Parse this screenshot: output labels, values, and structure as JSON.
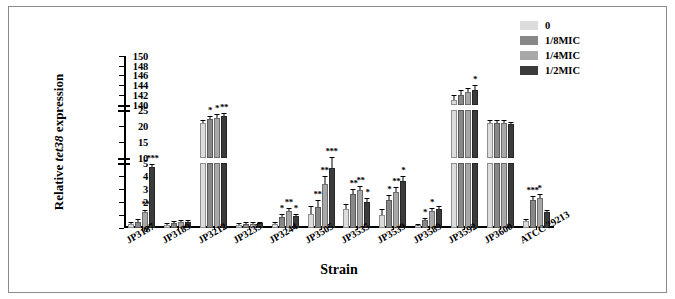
{
  "figure": {
    "background": "#ffffff",
    "border_color": "#8a8a8a"
  },
  "legend": {
    "position": "top-right",
    "items": [
      {
        "label": "0",
        "color": "#dcdcdc"
      },
      {
        "label": "1/8MIC",
        "color": "#888888"
      },
      {
        "label": "1/4MIC",
        "color": "#a8a8a8"
      },
      {
        "label": "1/2MIC",
        "color": "#3b3b3b"
      }
    ]
  },
  "chart_data": {
    "type": "bar",
    "title": "",
    "xlabel": "Strain",
    "ylabel": "Relative tet38 expression",
    "ylabel_italic_part": "tet38",
    "grid": false,
    "broken_axis": true,
    "axis_segments": [
      {
        "name": "lower",
        "range": [
          0,
          5
        ],
        "ticks": [
          0,
          1,
          2,
          3,
          4,
          5
        ],
        "height_frac": 0.4
      },
      {
        "name": "middle",
        "range": [
          10,
          25
        ],
        "ticks": [
          10,
          15,
          20,
          25
        ],
        "height_frac": 0.3
      },
      {
        "name": "upper",
        "range": [
          140,
          150
        ],
        "ticks": [
          140,
          142,
          144,
          146,
          148,
          150
        ],
        "height_frac": 0.3
      }
    ],
    "categories": [
      "JP3187",
      "JP3189",
      "JP3212",
      "JP3235",
      "JP3244",
      "JP3505",
      "JP3535",
      "JP3539",
      "JP3589",
      "JP3592",
      "JP3600",
      "ATCC 29213"
    ],
    "series": [
      {
        "name": "0",
        "color": "#dcdcdc",
        "values": [
          0.3,
          0.25,
          21.0,
          0.25,
          0.3,
          1.1,
          1.5,
          1.0,
          0.2,
          141.0,
          21.0,
          0.55
        ]
      },
      {
        "name": "1/8MIC",
        "color": "#888888",
        "values": [
          0.5,
          0.4,
          22.0,
          0.3,
          0.85,
          1.6,
          2.6,
          2.2,
          0.6,
          142.0,
          21.0,
          2.2
        ]
      },
      {
        "name": "1/4MIC",
        "color": "#a8a8a8",
        "values": [
          1.2,
          0.45,
          22.5,
          0.3,
          1.35,
          3.4,
          2.9,
          2.8,
          1.3,
          142.5,
          21.0,
          2.3
        ]
      },
      {
        "name": "1/2MIC",
        "color": "#3b3b3b",
        "values": [
          4.7,
          0.5,
          23.0,
          0.35,
          0.9,
          4.6,
          2.0,
          3.6,
          1.5,
          143.0,
          20.5,
          1.2
        ]
      }
    ],
    "errors": [
      {
        "name": "0",
        "values": [
          0.08,
          0.06,
          0.6,
          0.05,
          0.08,
          0.55,
          0.25,
          0.4,
          0.05,
          0.8,
          0.5,
          0.1
        ]
      },
      {
        "name": "1/8MIC",
        "values": [
          0.1,
          0.06,
          0.7,
          0.05,
          0.12,
          0.45,
          0.3,
          0.3,
          0.1,
          0.8,
          0.5,
          0.2
        ]
      },
      {
        "name": "1/4MIC",
        "values": [
          0.15,
          0.06,
          0.7,
          0.05,
          0.15,
          0.5,
          0.3,
          0.3,
          0.15,
          0.8,
          0.5,
          0.25
        ]
      },
      {
        "name": "1/2MIC",
        "values": [
          0.2,
          0.06,
          0.8,
          0.05,
          0.12,
          0.6,
          0.25,
          0.35,
          0.15,
          0.8,
          0.5,
          0.12
        ]
      }
    ],
    "significance": [
      {
        "category": "JP3187",
        "series": "1/4MIC",
        "marker": "**"
      },
      {
        "category": "JP3187",
        "series": "1/2MIC",
        "marker": "***"
      },
      {
        "category": "JP3212",
        "series": "1/8MIC",
        "marker": "*"
      },
      {
        "category": "JP3212",
        "series": "1/4MIC",
        "marker": "*"
      },
      {
        "category": "JP3212",
        "series": "1/2MIC",
        "marker": "**"
      },
      {
        "category": "JP3244",
        "series": "1/8MIC",
        "marker": "*"
      },
      {
        "category": "JP3244",
        "series": "1/4MIC",
        "marker": "**"
      },
      {
        "category": "JP3244",
        "series": "1/2MIC",
        "marker": "*"
      },
      {
        "category": "JP3505",
        "series": "1/8MIC",
        "marker": "**"
      },
      {
        "category": "JP3505",
        "series": "1/4MIC",
        "marker": "**"
      },
      {
        "category": "JP3505",
        "series": "1/2MIC",
        "marker": "***"
      },
      {
        "category": "JP3535",
        "series": "1/8MIC",
        "marker": "**"
      },
      {
        "category": "JP3535",
        "series": "1/4MIC",
        "marker": "**"
      },
      {
        "category": "JP3535",
        "series": "1/2MIC",
        "marker": "*"
      },
      {
        "category": "JP3539",
        "series": "1/8MIC",
        "marker": "*"
      },
      {
        "category": "JP3539",
        "series": "1/4MIC",
        "marker": "**"
      },
      {
        "category": "JP3539",
        "series": "1/2MIC",
        "marker": "*"
      },
      {
        "category": "JP3589",
        "series": "1/8MIC",
        "marker": "*"
      },
      {
        "category": "JP3589",
        "series": "1/4MIC",
        "marker": "*"
      },
      {
        "category": "JP3592",
        "series": "1/2MIC",
        "marker": "*"
      },
      {
        "category": "ATCC 29213",
        "series": "1/8MIC",
        "marker": "***"
      },
      {
        "category": "ATCC 29213",
        "series": "1/4MIC",
        "marker": "*"
      }
    ]
  }
}
